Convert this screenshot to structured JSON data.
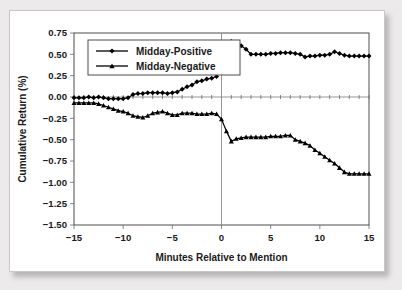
{
  "figure": {
    "panel_background": "#ffffff",
    "page_background": "#eceaea",
    "border_color": "#c9c7c7"
  },
  "chart_data": {
    "type": "line",
    "title": "",
    "xlabel": "Minutes Relative to Mention",
    "ylabel": "Cumulative Return (%)",
    "xlim": [
      -15,
      15
    ],
    "ylim": [
      -1.5,
      0.75
    ],
    "xticks": [
      -15,
      -10,
      -5,
      0,
      5,
      10,
      15
    ],
    "xtick_labels": [
      "−15",
      "−10",
      "−5",
      "0",
      "5",
      "10",
      "15"
    ],
    "yticks": [
      0.75,
      0.5,
      0.25,
      0.0,
      -0.25,
      -0.5,
      -0.75,
      -1.0,
      -1.25,
      -1.5
    ],
    "ytick_labels": [
      "0.75",
      "0.50",
      "0.25",
      "0.00",
      "−0.25",
      "−0.50",
      "−0.75",
      "−1.00",
      "−1.25",
      "−1.50"
    ],
    "grid": false,
    "zero_line": true,
    "event_line_x": 0,
    "legend_position": "upper-left",
    "series": [
      {
        "name": "Midday-Positive",
        "marker": "diamond",
        "color": "#000000",
        "x": [
          -15,
          -14.5,
          -14,
          -13.5,
          -13,
          -12.5,
          -12,
          -11.5,
          -11,
          -10.5,
          -10,
          -9.5,
          -9,
          -8.5,
          -8,
          -7.5,
          -7,
          -6.5,
          -6,
          -5.5,
          -5,
          -4.5,
          -4,
          -3.5,
          -3,
          -2.5,
          -2,
          -1.5,
          -1,
          -0.5,
          0,
          0.5,
          1,
          1.5,
          2,
          2.5,
          3,
          3.5,
          4,
          4.5,
          5,
          5.5,
          6,
          6.5,
          7,
          7.5,
          8,
          8.5,
          9,
          9.5,
          10,
          10.5,
          11,
          11.5,
          12,
          12.5,
          13,
          13.5,
          14,
          14.5,
          15
        ],
        "y": [
          -0.01,
          -0.01,
          -0.01,
          0.0,
          -0.01,
          0.0,
          -0.01,
          -0.02,
          -0.02,
          -0.02,
          -0.02,
          -0.01,
          0.03,
          0.04,
          0.04,
          0.05,
          0.05,
          0.05,
          0.05,
          0.04,
          0.05,
          0.06,
          0.09,
          0.12,
          0.14,
          0.18,
          0.19,
          0.21,
          0.22,
          0.24,
          0.39,
          0.58,
          0.65,
          0.63,
          0.6,
          0.56,
          0.5,
          0.5,
          0.5,
          0.5,
          0.51,
          0.51,
          0.52,
          0.52,
          0.52,
          0.51,
          0.5,
          0.47,
          0.48,
          0.48,
          0.49,
          0.49,
          0.5,
          0.53,
          0.51,
          0.49,
          0.48,
          0.48,
          0.48,
          0.48,
          0.48
        ]
      },
      {
        "name": "Midday-Negative",
        "marker": "triangle",
        "color": "#000000",
        "x": [
          -15,
          -14.5,
          -14,
          -13.5,
          -13,
          -12.5,
          -12,
          -11.5,
          -11,
          -10.5,
          -10,
          -9.5,
          -9,
          -8.5,
          -8,
          -7.5,
          -7,
          -6.5,
          -6,
          -5.5,
          -5,
          -4.5,
          -4,
          -3.5,
          -3,
          -2.5,
          -2,
          -1.5,
          -1,
          -0.5,
          0,
          0.5,
          1,
          1.5,
          2,
          2.5,
          3,
          3.5,
          4,
          4.5,
          5,
          5.5,
          6,
          6.5,
          7,
          7.5,
          8,
          8.5,
          9,
          9.5,
          10,
          10.5,
          11,
          11.5,
          12,
          12.5,
          13,
          13.5,
          14,
          14.5,
          15
        ],
        "y": [
          -0.07,
          -0.07,
          -0.07,
          -0.07,
          -0.07,
          -0.08,
          -0.1,
          -0.12,
          -0.14,
          -0.16,
          -0.17,
          -0.19,
          -0.22,
          -0.23,
          -0.24,
          -0.22,
          -0.19,
          -0.18,
          -0.17,
          -0.19,
          -0.21,
          -0.21,
          -0.19,
          -0.19,
          -0.19,
          -0.2,
          -0.2,
          -0.2,
          -0.19,
          -0.2,
          -0.26,
          -0.4,
          -0.52,
          -0.49,
          -0.48,
          -0.47,
          -0.47,
          -0.47,
          -0.47,
          -0.47,
          -0.46,
          -0.46,
          -0.46,
          -0.45,
          -0.45,
          -0.5,
          -0.52,
          -0.54,
          -0.57,
          -0.62,
          -0.66,
          -0.7,
          -0.74,
          -0.78,
          -0.83,
          -0.88,
          -0.9,
          -0.9,
          -0.9,
          -0.9,
          -0.9
        ]
      }
    ]
  }
}
